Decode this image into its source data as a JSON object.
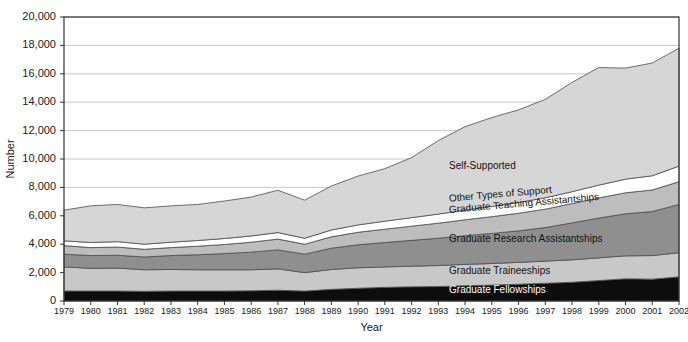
{
  "chart_data": {
    "type": "area",
    "title": "",
    "xlabel": "Year",
    "ylabel": "Number",
    "stacked": true,
    "grid": true,
    "legend_position": "inline-annotations",
    "xlim": [
      1979,
      2002
    ],
    "ylim": [
      0,
      20000
    ],
    "ytick_step": 2000,
    "x": [
      1979,
      1980,
      1981,
      1982,
      1983,
      1984,
      1985,
      1986,
      1987,
      1988,
      1989,
      1990,
      1991,
      1992,
      1993,
      1994,
      1995,
      1996,
      1997,
      1998,
      1999,
      2000,
      2001,
      2002
    ],
    "categories": [
      "1979",
      "1980",
      "1981",
      "1982",
      "1983",
      "1984",
      "1985",
      "1986",
      "1987",
      "1988",
      "1989",
      "1990",
      "1991",
      "1992",
      "1993",
      "1994",
      "1995",
      "1996",
      "1997",
      "1998",
      "1999",
      "2000",
      "2001",
      "2002"
    ],
    "xtick_labels": [
      "1979",
      "1980",
      "1981",
      "1982",
      "1983",
      "1984",
      "1985",
      "1986",
      "1987",
      "1988",
      "1989",
      "1990",
      "1991",
      "1992",
      "1993",
      "1994",
      "1995",
      "1996",
      "1997",
      "1998",
      "1999",
      "2000",
      "2001",
      "2002"
    ],
    "ytick_labels": [
      "0",
      "2,000",
      "4,000",
      "6,000",
      "8,000",
      "10,000",
      "12,000",
      "14,000",
      "16,000",
      "18,000",
      "20,000"
    ],
    "ytick_values": [
      0,
      2000,
      4000,
      6000,
      8000,
      10000,
      12000,
      14000,
      16000,
      18000,
      20000
    ],
    "series": [
      {
        "name": "Graduate Fellowships",
        "color": "#0d0d0d",
        "label_color": "#ffffff",
        "values": [
          700,
          700,
          700,
          680,
          700,
          700,
          700,
          720,
          760,
          700,
          820,
          900,
          960,
          1000,
          1020,
          1080,
          1120,
          1180,
          1250,
          1320,
          1440,
          1560,
          1540,
          1700
        ]
      },
      {
        "name": "Graduate Traineeships",
        "color": "#c8c8c8",
        "label_color": "#111111",
        "values": [
          1700,
          1600,
          1620,
          1520,
          1520,
          1500,
          1500,
          1480,
          1500,
          1300,
          1400,
          1440,
          1440,
          1450,
          1480,
          1500,
          1520,
          1540,
          1560,
          1580,
          1600,
          1620,
          1660,
          1700
        ]
      },
      {
        "name": "Graduate Research Assistantships",
        "color": "#8f8f8f",
        "label_color": "#111111",
        "values": [
          900,
          900,
          900,
          900,
          980,
          1060,
          1140,
          1240,
          1340,
          1300,
          1500,
          1620,
          1720,
          1820,
          1920,
          2020,
          2120,
          2220,
          2360,
          2600,
          2800,
          2960,
          3100,
          3400
        ]
      },
      {
        "name": "Graduate Teaching Assistantships",
        "color": "#bdbdbd",
        "label_color": "#111111",
        "values": [
          600,
          560,
          580,
          540,
          560,
          600,
          640,
          700,
          760,
          700,
          800,
          880,
          940,
          1000,
          1060,
          1120,
          1180,
          1240,
          1300,
          1360,
          1420,
          1480,
          1520,
          1600
        ]
      },
      {
        "name": "Other Types of Support",
        "color": "#ffffff",
        "label_color": "#111111",
        "values": [
          340,
          360,
          380,
          360,
          380,
          400,
          420,
          440,
          460,
          420,
          480,
          520,
          560,
          600,
          640,
          680,
          720,
          760,
          800,
          840,
          900,
          960,
          1000,
          1100
        ]
      },
      {
        "name": "Self-Supported",
        "color": "#d6d6d6",
        "label_color": "#111111",
        "values": [
          2160,
          2580,
          2620,
          2560,
          2560,
          2540,
          2640,
          2740,
          2980,
          2680,
          3100,
          3440,
          3700,
          4230,
          5180,
          5880,
          6260,
          6520,
          6930,
          7700,
          8280,
          7820,
          7940,
          8300
        ]
      }
    ],
    "totals": [
      6400,
      6700,
      6800,
      6560,
      6700,
      6800,
      7040,
      7320,
      7800,
      7100,
      8100,
      8800,
      9320,
      10100,
      11300,
      12280,
      12920,
      13460,
      14200,
      15400,
      16440,
      16400,
      16760,
      17800
    ],
    "annotations": [
      {
        "text": "Self-Supported",
        "x_year": 1993.4,
        "y_value": 9500
      },
      {
        "text": "Other Types of Support",
        "x_year": 1993.4,
        "y_value": 7180,
        "rotate": -5
      },
      {
        "text": "Graduate Teaching Assistantships",
        "x_year": 1993.4,
        "y_value": 6380,
        "rotate": -5
      },
      {
        "text": "Graduate Research Assistantships",
        "x_year": 1993.4,
        "y_value": 4350
      },
      {
        "text": "Graduate Traineeships",
        "x_year": 1993.4,
        "y_value": 2120
      },
      {
        "text": "Graduate Fellowships",
        "x_year": 1993.4,
        "y_value": 780
      }
    ]
  }
}
